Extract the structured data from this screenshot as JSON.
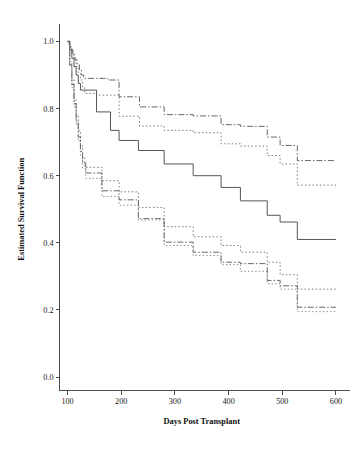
{
  "figure": {
    "background_color": "#ffffff",
    "width": 354,
    "height": 453
  },
  "chart_data": {
    "type": "line",
    "subtype": "kaplan-meier-step",
    "title": "",
    "subtitle": "",
    "xlabel": "Days Post Transplant",
    "ylabel": "Estimated Survival Function",
    "xlim": [
      85,
      615
    ],
    "ylim": [
      -0.04,
      1.04
    ],
    "xticks": [
      100,
      200,
      300,
      400,
      500,
      600
    ],
    "xtick_labels": [
      "100",
      "200",
      "300",
      "400",
      "500",
      "600"
    ],
    "yticks": [
      0.0,
      0.2,
      0.4,
      0.6,
      0.8,
      1.0
    ],
    "ytick_labels": [
      "0.0",
      "0.2",
      "0.4",
      "0.6",
      "0.8",
      "1.0"
    ],
    "grid": false,
    "legend": null,
    "legend_position": "none",
    "axis_spines": [
      "left",
      "bottom"
    ],
    "tick_direction": "out",
    "annotations": [],
    "series": [
      {
        "name": "upper-band-dashdot",
        "style": "dash-dot",
        "color": "#4d4d4d",
        "dasharray": "6,2,1.5,2",
        "width": 0.85,
        "x": [
          100,
          103,
          106,
          110,
          114,
          118,
          122,
          126,
          130,
          170,
          175,
          192,
          196,
          230,
          234,
          276,
          280,
          330,
          334,
          382,
          386,
          418,
          422,
          468,
          472,
          492,
          496,
          524,
          528,
          600
        ],
        "y": [
          1.0,
          0.99,
          0.975,
          0.96,
          0.945,
          0.93,
          0.915,
          0.9,
          0.89,
          0.89,
          0.885,
          0.885,
          0.835,
          0.835,
          0.805,
          0.805,
          0.782,
          0.782,
          0.778,
          0.778,
          0.752,
          0.752,
          0.747,
          0.747,
          0.715,
          0.715,
          0.69,
          0.69,
          0.645,
          0.645
        ]
      },
      {
        "name": "upper-band-dotted",
        "style": "dotted",
        "color": "#6b6b6b",
        "dasharray": "1.6,2.1",
        "width": 0.85,
        "x": [
          100,
          104,
          108,
          112,
          116,
          120,
          124,
          128,
          132,
          150,
          154,
          192,
          196,
          230,
          234,
          276,
          280,
          330,
          334,
          382,
          386,
          418,
          422,
          468,
          472,
          492,
          496,
          524,
          528,
          600
        ],
        "y": [
          1.0,
          0.985,
          0.965,
          0.945,
          0.925,
          0.905,
          0.885,
          0.862,
          0.845,
          0.845,
          0.84,
          0.84,
          0.777,
          0.777,
          0.748,
          0.748,
          0.735,
          0.735,
          0.728,
          0.728,
          0.695,
          0.695,
          0.688,
          0.688,
          0.66,
          0.66,
          0.635,
          0.635,
          0.572,
          0.572
        ]
      },
      {
        "name": "center-estimate-solid",
        "style": "solid",
        "color": "#555555",
        "dasharray": "none",
        "width": 1.0,
        "x": [
          100,
          104,
          108,
          112,
          116,
          120,
          124,
          150,
          154,
          176,
          180,
          192,
          196,
          228,
          232,
          276,
          280,
          330,
          334,
          382,
          386,
          418,
          422,
          468,
          472,
          492,
          496,
          524,
          528,
          600
        ],
        "y": [
          1.0,
          0.975,
          0.95,
          0.925,
          0.9,
          0.875,
          0.855,
          0.855,
          0.79,
          0.79,
          0.735,
          0.735,
          0.705,
          0.705,
          0.675,
          0.675,
          0.635,
          0.635,
          0.6,
          0.6,
          0.565,
          0.565,
          0.525,
          0.525,
          0.482,
          0.482,
          0.462,
          0.462,
          0.41,
          0.41
        ]
      },
      {
        "name": "lower-band-dotted-upper",
        "style": "dotted",
        "color": "#6b6b6b",
        "dasharray": "1.6,2.1",
        "width": 0.85,
        "x": [
          100,
          104,
          108,
          112,
          116,
          120,
          124,
          128,
          132,
          160,
          164,
          192,
          196,
          228,
          232,
          276,
          280,
          330,
          334,
          382,
          386,
          418,
          422,
          468,
          472,
          492,
          496,
          524,
          528,
          600
        ],
        "y": [
          1.0,
          0.94,
          0.885,
          0.83,
          0.78,
          0.735,
          0.69,
          0.655,
          0.625,
          0.625,
          0.585,
          0.585,
          0.552,
          0.552,
          0.505,
          0.505,
          0.448,
          0.448,
          0.418,
          0.418,
          0.392,
          0.392,
          0.372,
          0.372,
          0.342,
          0.342,
          0.305,
          0.305,
          0.262,
          0.262
        ]
      },
      {
        "name": "lower-band-dashdot",
        "style": "dash-dot",
        "color": "#4d4d4d",
        "dasharray": "6,2,1.5,2",
        "width": 0.85,
        "x": [
          100,
          104,
          108,
          112,
          116,
          120,
          124,
          128,
          134,
          160,
          164,
          192,
          196,
          228,
          232,
          276,
          280,
          330,
          334,
          382,
          386,
          418,
          422,
          468,
          472,
          492,
          496,
          524,
          528,
          600
        ],
        "y": [
          1.0,
          0.93,
          0.872,
          0.815,
          0.762,
          0.715,
          0.672,
          0.638,
          0.608,
          0.608,
          0.555,
          0.555,
          0.528,
          0.528,
          0.472,
          0.472,
          0.402,
          0.402,
          0.372,
          0.372,
          0.342,
          0.342,
          0.338,
          0.338,
          0.288,
          0.288,
          0.272,
          0.272,
          0.208,
          0.208
        ]
      },
      {
        "name": "lower-band-dotted-lower",
        "style": "dotted",
        "color": "#767676",
        "dasharray": "1.4,2.2",
        "width": 0.85,
        "x": [
          100,
          104,
          108,
          112,
          116,
          120,
          124,
          128,
          134,
          160,
          164,
          192,
          196,
          228,
          232,
          276,
          280,
          330,
          334,
          382,
          386,
          418,
          422,
          468,
          472,
          492,
          496,
          524,
          528,
          600
        ],
        "y": [
          1.0,
          0.925,
          0.862,
          0.805,
          0.752,
          0.702,
          0.658,
          0.622,
          0.592,
          0.592,
          0.538,
          0.538,
          0.512,
          0.512,
          0.468,
          0.468,
          0.392,
          0.392,
          0.362,
          0.362,
          0.335,
          0.335,
          0.315,
          0.315,
          0.278,
          0.278,
          0.262,
          0.262,
          0.195,
          0.195
        ]
      }
    ]
  }
}
